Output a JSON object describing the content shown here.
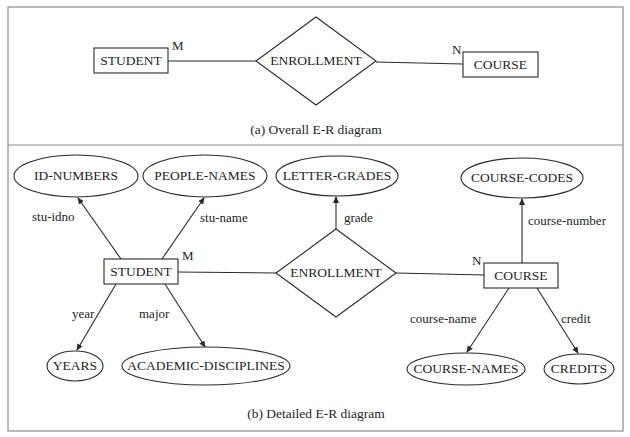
{
  "colors": {
    "ink": "#1e1e1e",
    "frame": "#8c8c8c",
    "background": "#ffffff"
  },
  "frame": {
    "x": 8,
    "y": 7,
    "w": 615,
    "h": 424,
    "divider_y": 145
  },
  "overall": {
    "caption": "(a) Overall E-R diagram",
    "caption_pos": [
      316,
      131
    ],
    "entities": [
      {
        "id": "student",
        "label": "STUDENT",
        "x": 94,
        "y": 48,
        "w": 74,
        "h": 25
      },
      {
        "id": "course",
        "label": "COURSE",
        "x": 463,
        "y": 52,
        "w": 75,
        "h": 25
      }
    ],
    "relationship": {
      "id": "enrollment",
      "label": "ENROLLMENT",
      "cx": 316,
      "cy": 61,
      "hw": 60,
      "hh": 44
    },
    "links": [
      {
        "x1": 168,
        "y1": 61,
        "x2": 256,
        "y2": 61
      },
      {
        "x1": 376,
        "y1": 62,
        "x2": 463,
        "y2": 64
      }
    ],
    "cardinalities": [
      {
        "label": "M",
        "x": 172,
        "y": 47
      },
      {
        "label": "N",
        "x": 452,
        "y": 51
      }
    ]
  },
  "detailed": {
    "caption": "(b) Detailed E-R diagram",
    "caption_pos": [
      316,
      415
    ],
    "entities": [
      {
        "id": "student",
        "label": "STUDENT",
        "x": 104,
        "y": 259,
        "w": 74,
        "h": 25
      },
      {
        "id": "course",
        "label": "COURSE",
        "x": 484,
        "y": 263,
        "w": 74,
        "h": 25
      }
    ],
    "relationship": {
      "id": "enrollment",
      "label": "ENROLLMENT",
      "cx": 336,
      "cy": 273,
      "hw": 60,
      "hh": 44
    },
    "value_sets": [
      {
        "id": "id-numbers",
        "label": "ID-NUMBERS",
        "cx": 76,
        "cy": 176,
        "rx": 62,
        "ry": 21
      },
      {
        "id": "people-names",
        "label": "PEOPLE-NAMES",
        "cx": 205,
        "cy": 176,
        "rx": 62,
        "ry": 21
      },
      {
        "id": "letter-grades",
        "label": "LETTER-GRADES",
        "cx": 337,
        "cy": 176,
        "rx": 61,
        "ry": 20
      },
      {
        "id": "course-codes",
        "label": "COURSE-CODES",
        "cx": 522,
        "cy": 178,
        "rx": 61,
        "ry": 20
      },
      {
        "id": "years",
        "label": "YEARS",
        "cx": 75,
        "cy": 366,
        "rx": 28,
        "ry": 15
      },
      {
        "id": "academic-disciplines",
        "label": "ACADEMIC-DISCIPLINES",
        "cx": 206,
        "cy": 366,
        "rx": 84,
        "ry": 19
      },
      {
        "id": "course-names",
        "label": "COURSE-NAMES",
        "cx": 466,
        "cy": 369,
        "rx": 59,
        "ry": 16
      },
      {
        "id": "credits",
        "label": "CREDITS",
        "cx": 579,
        "cy": 369,
        "rx": 35,
        "ry": 15
      }
    ],
    "attributes": [
      {
        "label": "stu-idno",
        "x1": 121,
        "y1": 259,
        "x2": 78,
        "y2": 198,
        "lx": 32,
        "ly": 218,
        "anchor": "start"
      },
      {
        "label": "stu-name",
        "x1": 162,
        "y1": 259,
        "x2": 204,
        "y2": 198,
        "lx": 200,
        "ly": 219,
        "anchor": "start"
      },
      {
        "label": "grade",
        "x1": 336,
        "y1": 229,
        "x2": 336,
        "y2": 197,
        "lx": 344,
        "ly": 219,
        "anchor": "start"
      },
      {
        "label": "course-number",
        "x1": 522,
        "y1": 263,
        "x2": 522,
        "y2": 199,
        "lx": 528,
        "ly": 222,
        "anchor": "start"
      },
      {
        "label": "year",
        "x1": 116,
        "y1": 284,
        "x2": 77,
        "y2": 350,
        "lx": 72,
        "ly": 315,
        "anchor": "start"
      },
      {
        "label": "major",
        "x1": 165,
        "y1": 284,
        "x2": 205,
        "y2": 347,
        "lx": 139,
        "ly": 315,
        "anchor": "start"
      },
      {
        "label": "course-name",
        "x1": 509,
        "y1": 288,
        "x2": 467,
        "y2": 352,
        "lx": 410,
        "ly": 320,
        "anchor": "start"
      },
      {
        "label": "credit",
        "x1": 537,
        "y1": 288,
        "x2": 578,
        "y2": 353,
        "lx": 561,
        "ly": 320,
        "anchor": "start"
      }
    ],
    "links": [
      {
        "x1": 178,
        "y1": 272,
        "x2": 276,
        "y2": 273
      },
      {
        "x1": 396,
        "y1": 273,
        "x2": 484,
        "y2": 275
      }
    ],
    "cardinalities": [
      {
        "label": "M",
        "x": 182,
        "y": 257
      },
      {
        "label": "N",
        "x": 472,
        "y": 262
      }
    ]
  }
}
